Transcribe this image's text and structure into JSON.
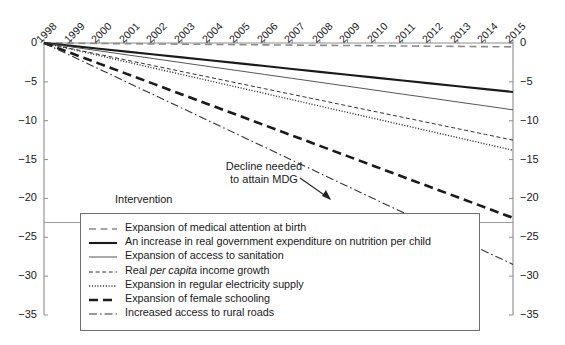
{
  "chart_data": {
    "type": "line",
    "title": "",
    "xlabel": "",
    "ylabel": "",
    "x": [
      1998,
      1999,
      2000,
      2001,
      2002,
      2003,
      2004,
      2005,
      2006,
      2007,
      2008,
      2009,
      2010,
      2011,
      2012,
      2013,
      2014,
      2015
    ],
    "xtick_labels": [
      "1998",
      "1999",
      "2000",
      "2001",
      "2002",
      "2003",
      "2004",
      "2005",
      "2006",
      "2007",
      "2008",
      "2009",
      "2010",
      "2011",
      "2012",
      "2013",
      "2014",
      "2015"
    ],
    "ytick_labels": [
      "0",
      "−5",
      "−10",
      "−15",
      "−20",
      "−25",
      "−30",
      "−35"
    ],
    "ytick_values": [
      0,
      -5,
      -10,
      -15,
      -20,
      -25,
      -30,
      -35
    ],
    "ylim": [
      -35,
      0
    ],
    "xlim": [
      1998,
      2015
    ],
    "grid": false,
    "legend_position": "inside-bottom",
    "axes_mirrored": true,
    "series": [
      {
        "name": "Expansion of medical attention at birth",
        "style": "dashed-gray",
        "endpoint": -0.5,
        "values": [
          0,
          -0.03,
          -0.06,
          -0.09,
          -0.12,
          -0.15,
          -0.18,
          -0.21,
          -0.24,
          -0.27,
          -0.3,
          -0.32,
          -0.35,
          -0.38,
          -0.41,
          -0.44,
          -0.47,
          -0.5
        ]
      },
      {
        "name": "An increase in real government expenditure on nutrition per child",
        "style": "solid-thick",
        "endpoint": -6.3,
        "values": [
          0,
          -0.37,
          -0.74,
          -1.11,
          -1.48,
          -1.85,
          -2.22,
          -2.59,
          -2.96,
          -3.34,
          -3.71,
          -4.08,
          -4.45,
          -4.82,
          -5.19,
          -5.56,
          -5.93,
          -6.3
        ]
      },
      {
        "name": "Expansion of access to sanitation",
        "style": "solid-thin",
        "endpoint": -8.6,
        "values": [
          0,
          -0.51,
          -1.01,
          -1.52,
          -2.02,
          -2.53,
          -3.04,
          -3.54,
          -4.05,
          -4.55,
          -5.06,
          -5.56,
          -6.07,
          -6.58,
          -7.08,
          -7.59,
          -8.09,
          -8.6
        ]
      },
      {
        "name": "Real per capita income growth",
        "style": "dashed-fine",
        "endpoint": -12.5,
        "values": [
          0,
          -0.74,
          -1.47,
          -2.21,
          -2.94,
          -3.68,
          -4.41,
          -5.15,
          -5.88,
          -6.62,
          -7.35,
          -8.09,
          -8.82,
          -9.56,
          -10.29,
          -11.03,
          -11.76,
          -12.5
        ],
        "label_italic_part": "per capita"
      },
      {
        "name": "Expansion in regular electricity supply",
        "style": "dotted",
        "endpoint": -13.8,
        "values": [
          0,
          -0.81,
          -1.62,
          -2.44,
          -3.25,
          -4.06,
          -4.87,
          -5.68,
          -6.49,
          -7.31,
          -8.12,
          -8.93,
          -9.74,
          -10.55,
          -11.36,
          -12.18,
          -12.99,
          -13.8
        ]
      },
      {
        "name": "Expansion of female schooling",
        "style": "dashed-thick",
        "endpoint": -22.5,
        "values": [
          0,
          -1.32,
          -2.65,
          -3.97,
          -5.29,
          -6.62,
          -7.94,
          -9.26,
          -10.59,
          -11.91,
          -13.24,
          -14.56,
          -15.88,
          -17.21,
          -18.53,
          -19.85,
          -21.18,
          -22.5
        ]
      },
      {
        "name": "Increased access to rural roads",
        "style": "dash-dot",
        "endpoint": -28.5,
        "values": [
          0,
          -1.68,
          -3.35,
          -5.03,
          -6.71,
          -8.38,
          -10.06,
          -11.74,
          -13.41,
          -15.09,
          -16.76,
          -18.44,
          -20.12,
          -21.79,
          -23.47,
          -25.15,
          -26.82,
          -28.5
        ]
      }
    ],
    "annotations": [
      {
        "name": "mdg-annotation",
        "line1": "Decline needed",
        "line2": "to attain MDG",
        "arrow": true
      }
    ],
    "reference_line": {
      "name": "mdg-target-line",
      "value": -23.1,
      "style": "solid-gray"
    }
  },
  "legend": {
    "title": "Intervention",
    "items": [
      {
        "label": "Expansion of medical attention at birth",
        "style": "dashed-gray"
      },
      {
        "label": "An increase in real government expenditure on nutrition per child",
        "style": "solid-thick"
      },
      {
        "label": "Expansion of access to sanitation",
        "style": "solid-thin"
      },
      {
        "label_pre": "Real ",
        "label_italic": "per capita",
        "label_post": " income growth",
        "style": "dashed-fine"
      },
      {
        "label": "Expansion in regular electricity supply",
        "style": "dotted"
      },
      {
        "label": "Expansion of female schooling",
        "style": "dashed-thick"
      },
      {
        "label": "Increased access to rural roads",
        "style": "dash-dot"
      }
    ]
  },
  "colors": {
    "axis": "#8c8c8c",
    "text": "#1a1a1a",
    "line_dark": "#1a1a1a",
    "line_gray": "#8c8c8c",
    "legend_border": "#6e6e6e"
  }
}
